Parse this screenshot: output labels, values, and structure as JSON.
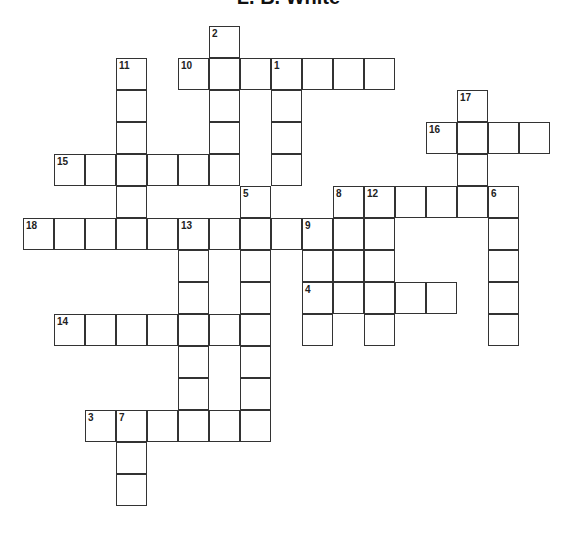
{
  "title": "L. B. White",
  "grid": {
    "origin_x": 24,
    "origin_y": 27,
    "cell_w": 31,
    "cell_h": 32
  },
  "words": [
    {
      "number": 1,
      "direction": "down",
      "col": 8,
      "row": 1,
      "length": 4
    },
    {
      "number": 2,
      "direction": "down",
      "col": 6,
      "row": 0,
      "length": 5
    },
    {
      "number": 3,
      "direction": "across",
      "col": 2,
      "row": 12,
      "length": 6
    },
    {
      "number": 4,
      "direction": "across",
      "col": 9,
      "row": 8,
      "length": 5
    },
    {
      "number": 5,
      "direction": "down",
      "col": 7,
      "row": 5,
      "length": 7
    },
    {
      "number": 6,
      "direction": "down",
      "col": 15,
      "row": 5,
      "length": 5
    },
    {
      "number": 7,
      "direction": "down",
      "col": 3,
      "row": 12,
      "length": 3
    },
    {
      "number": 8,
      "direction": "across",
      "col": 10,
      "row": 5,
      "length": 6
    },
    {
      "number": 8,
      "direction": "down",
      "col": 10,
      "row": 5,
      "length": 4
    },
    {
      "number": 9,
      "direction": "down",
      "col": 9,
      "row": 6,
      "length": 4
    },
    {
      "number": 10,
      "direction": "across",
      "col": 5,
      "row": 1,
      "length": 7
    },
    {
      "number": 11,
      "direction": "down",
      "col": 3,
      "row": 1,
      "length": 6
    },
    {
      "number": 12,
      "direction": "down",
      "col": 11,
      "row": 5,
      "length": 5
    },
    {
      "number": 13,
      "direction": "down",
      "col": 5,
      "row": 6,
      "length": 7
    },
    {
      "number": 14,
      "direction": "across",
      "col": 1,
      "row": 9,
      "length": 7
    },
    {
      "number": 15,
      "direction": "across",
      "col": 1,
      "row": 4,
      "length": 6
    },
    {
      "number": 16,
      "direction": "across",
      "col": 13,
      "row": 3,
      "length": 4
    },
    {
      "number": 17,
      "direction": "down",
      "col": 14,
      "row": 2,
      "length": 4
    },
    {
      "number": 18,
      "direction": "across",
      "col": 0,
      "row": 6,
      "length": 10
    }
  ]
}
